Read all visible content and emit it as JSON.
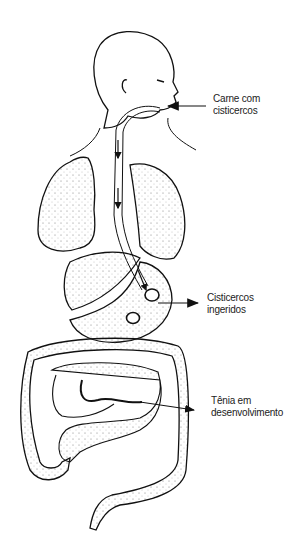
{
  "diagram": {
    "labels": [
      {
        "line1": "Carne com",
        "line2": "cisticercos"
      },
      {
        "line1": "Cisticercos",
        "line2": "ingeridos"
      },
      {
        "line1": "Tênia em",
        "line2": "desenvolvimento"
      }
    ],
    "colors": {
      "stroke": "#111111",
      "fill": "#ffffff",
      "stipple": "#555555"
    }
  }
}
